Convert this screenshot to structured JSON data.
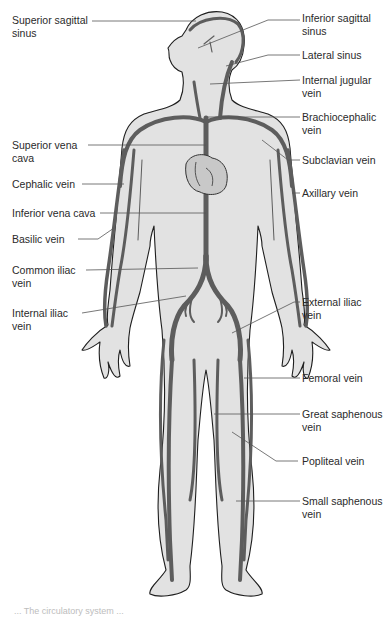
{
  "diagram": {
    "type": "anatomical-illustration",
    "colors": {
      "body_fill": "#e2e2e2",
      "outline": "#1e1e1e",
      "vein": "#5d5d5d",
      "leader_line": "#555555",
      "text": "#2a2a2a"
    }
  },
  "labels_left": [
    {
      "id": "superior-sagittal-sinus",
      "text": "Superior sagittal\nsinus",
      "x": 12,
      "y": 14
    },
    {
      "id": "superior-vena-cava",
      "text": "Superior vena\ncava",
      "x": 12,
      "y": 139
    },
    {
      "id": "cephalic-vein",
      "text": "Cephalic vein",
      "x": 12,
      "y": 178
    },
    {
      "id": "inferior-vena-cava",
      "text": "Inferior vena cava",
      "x": 12,
      "y": 207
    },
    {
      "id": "basilic-vein",
      "text": "Basilic vein",
      "x": 12,
      "y": 233
    },
    {
      "id": "common-iliac-vein",
      "text": "Common iliac\nvein",
      "x": 12,
      "y": 266
    },
    {
      "id": "internal-iliac-vein",
      "text": "Internal iliac\nvein",
      "x": 12,
      "y": 307
    }
  ],
  "labels_right": [
    {
      "id": "inferior-sagittal-sinus",
      "text": "Inferior sagittal\nsinus",
      "x": 302,
      "y": 12
    },
    {
      "id": "lateral-sinus",
      "text": "Lateral sinus",
      "x": 302,
      "y": 49
    },
    {
      "id": "internal-jugular-vein",
      "text": "Internal jugular\nvein",
      "x": 302,
      "y": 74
    },
    {
      "id": "brachiocephalic-vein",
      "text": "Brachiocephalic\nvein",
      "x": 302,
      "y": 111
    },
    {
      "id": "subclavian-vein",
      "text": "Subclavian vein",
      "x": 302,
      "y": 154
    },
    {
      "id": "axillary-vein",
      "text": "Axillary vein",
      "x": 302,
      "y": 187
    },
    {
      "id": "external-iliac-vein",
      "text": "External iliac\nvein",
      "x": 302,
      "y": 296
    },
    {
      "id": "femoral-vein",
      "text": "Femoral vein",
      "x": 302,
      "y": 372
    },
    {
      "id": "great-saphenous-vein",
      "text": "Great saphenous\nvein",
      "x": 302,
      "y": 409
    },
    {
      "id": "popliteal-vein",
      "text": "Popliteal vein",
      "x": 302,
      "y": 455
    },
    {
      "id": "small-saphenous-vein",
      "text": "Small saphenous\nvein",
      "x": 302,
      "y": 495
    }
  ],
  "caption": "... The circulatory system ..."
}
